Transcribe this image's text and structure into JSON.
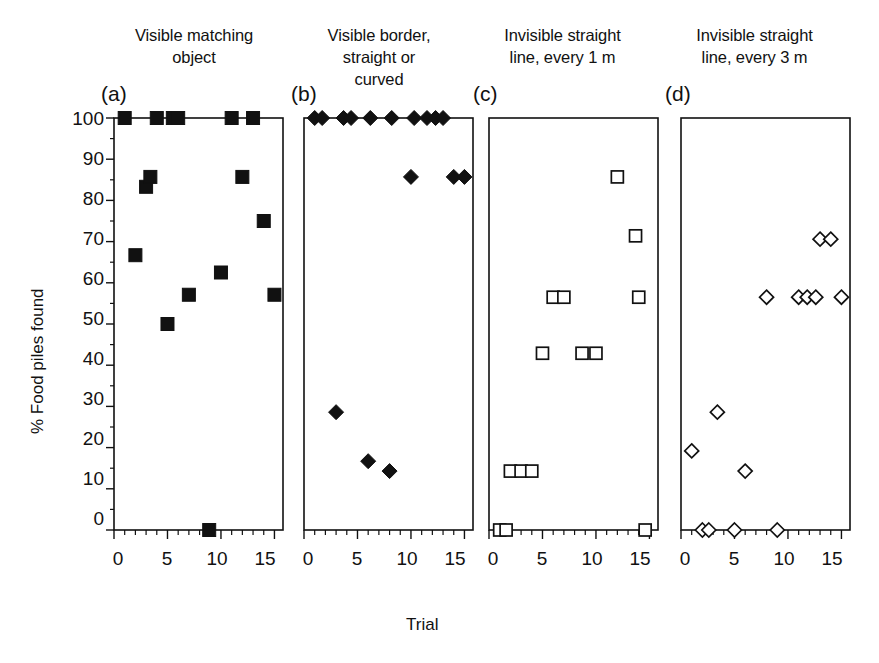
{
  "figure": {
    "y_axis_label": "% Food piles found",
    "x_axis_label": "Trial"
  },
  "panels": [
    {
      "letter": "(a)",
      "title_line1": "Visible matching",
      "title_line2": "object",
      "marker": "filled-square"
    },
    {
      "letter": "(b)",
      "title_line1": "Visible border,",
      "title_line2": "straight or curved",
      "marker": "filled-diamond"
    },
    {
      "letter": "(c)",
      "title_line1": "Invisible straight",
      "title_line2": "line, every 1 m",
      "marker": "open-square"
    },
    {
      "letter": "(d)",
      "title_line1": "Invisible straight",
      "title_line2": "line, every 3 m",
      "marker": "open-diamond"
    }
  ],
  "axes": {
    "y_ticks": [
      0,
      10,
      20,
      30,
      40,
      50,
      60,
      70,
      80,
      90,
      100
    ],
    "y_tick_labels": [
      "0",
      "10",
      "20",
      "30",
      "40",
      "50",
      "60",
      "70",
      "80",
      "90",
      "100"
    ],
    "x_ticks": [
      0,
      5,
      10,
      15
    ],
    "x_tick_labels": [
      "0",
      "5",
      "10",
      "15"
    ],
    "x_minor_step": 1,
    "ylim": [
      0,
      100
    ],
    "xlim": [
      0,
      15.8
    ]
  },
  "chart_data": {
    "type": "scatter",
    "title": "",
    "xlabel": "Trial",
    "ylabel": "% Food piles found",
    "xlim": [
      0,
      15.8
    ],
    "ylim": [
      0,
      100
    ],
    "grid": false,
    "legend": "none",
    "panels": [
      {
        "id": "a",
        "label": "(a)",
        "title": "Visible matching object",
        "marker": "filled-square",
        "x": [
          1,
          2,
          3,
          3.4,
          4,
          5,
          5.5,
          6,
          7,
          8.9,
          10,
          11,
          12,
          13,
          14,
          15
        ],
        "y": [
          100,
          66.7,
          83.3,
          85.7,
          100,
          50,
          100,
          100,
          57.1,
          0,
          62.5,
          100,
          85.7,
          100,
          75,
          57.1
        ]
      },
      {
        "id": "b",
        "label": "(b)",
        "title": "Visible border, straight or curved",
        "marker": "filled-diamond",
        "x": [
          1,
          1.7,
          3,
          3.7,
          4.4,
          6,
          6.2,
          8,
          8.2,
          10,
          10.3,
          11.5,
          12.3,
          13,
          14,
          15
        ],
        "y": [
          100,
          100,
          28.6,
          100,
          100,
          16.7,
          100,
          14.3,
          100,
          85.7,
          100,
          100,
          100,
          100,
          85.7,
          85.7
        ]
      },
      {
        "id": "c",
        "label": "(c)",
        "title": "Invisible straight line, every 1 m",
        "marker": "open-square",
        "x": [
          1,
          1.6,
          2,
          3,
          4,
          5,
          6,
          7,
          8.7,
          10,
          12,
          13.7,
          14,
          14.6
        ],
        "y": [
          0,
          0,
          14.3,
          14.3,
          14.3,
          42.9,
          56.5,
          56.5,
          42.9,
          42.9,
          85.7,
          71.4,
          56.5,
          0
        ]
      },
      {
        "id": "d",
        "label": "(d)",
        "title": "Invisible straight line, every 3 m",
        "marker": "open-diamond",
        "x": [
          1,
          2,
          2.6,
          3.4,
          5,
          6,
          8,
          9,
          11,
          11.8,
          12.6,
          13,
          14,
          15
        ],
        "y": [
          19.2,
          0,
          0,
          28.6,
          0,
          14.3,
          56.5,
          0,
          56.5,
          56.5,
          56.5,
          70.6,
          70.6,
          56.5
        ]
      }
    ]
  }
}
